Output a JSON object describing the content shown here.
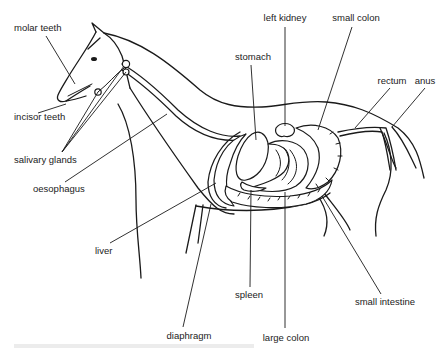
{
  "diagram": {
    "stroke_color": "#1a1a1a",
    "label_color": "#222222",
    "background": "#ffffff",
    "labels": [
      {
        "id": "molar-teeth",
        "text": "molar teeth",
        "x": 14,
        "y": 31,
        "anchor": "start",
        "leader": [
          [
            46,
            36
          ],
          [
            75,
            84
          ]
        ]
      },
      {
        "id": "incisor-teeth",
        "text": "incisor teeth",
        "x": 14,
        "y": 120,
        "anchor": "start",
        "leader": [
          [
            38,
            113
          ],
          [
            66,
            104
          ]
        ]
      },
      {
        "id": "salivary-glands",
        "text": "salivary glands",
        "x": 14,
        "y": 163,
        "anchor": "start",
        "leader": [
          [
            62,
            152
          ],
          [
            98,
            92
          ],
          [
            62,
            152
          ],
          [
            97,
            103
          ],
          [
            62,
            152
          ],
          [
            66,
            100
          ]
        ]
      },
      {
        "id": "oesophagus",
        "text": "oesophagus",
        "x": 33,
        "y": 192,
        "anchor": "start",
        "leader": [
          [
            65,
            182
          ],
          [
            167,
            114
          ]
        ]
      },
      {
        "id": "liver",
        "text": "liver",
        "x": 95,
        "y": 254,
        "anchor": "start",
        "leader": [
          [
            110,
            243
          ],
          [
            216,
            183
          ]
        ]
      },
      {
        "id": "stomach",
        "text": "stomach",
        "x": 253,
        "y": 60,
        "anchor": "middle",
        "leader": [
          [
            251,
            65
          ],
          [
            256,
            132
          ]
        ]
      },
      {
        "id": "left-kidney",
        "text": "left kidney",
        "x": 285,
        "y": 21,
        "anchor": "middle",
        "leader": [
          [
            285,
            27
          ],
          [
            285,
            125
          ]
        ]
      },
      {
        "id": "small-colon",
        "text": "small colon",
        "x": 356,
        "y": 21,
        "anchor": "middle",
        "leader": [
          [
            352,
            27
          ],
          [
            318,
            127
          ]
        ]
      },
      {
        "id": "rectum",
        "text": "rectum",
        "x": 392,
        "y": 84,
        "anchor": "middle",
        "leader": [
          [
            390,
            88
          ],
          [
            355,
            125
          ]
        ]
      },
      {
        "id": "anus",
        "text": "anus",
        "x": 425,
        "y": 84,
        "anchor": "middle",
        "leader": [
          [
            425,
            88
          ],
          [
            392,
            127
          ]
        ]
      },
      {
        "id": "spleen",
        "text": "spleen",
        "x": 249,
        "y": 298,
        "anchor": "middle",
        "leader": [
          [
            250,
            287
          ],
          [
            251,
            194
          ]
        ]
      },
      {
        "id": "small-intestine",
        "text": "small intestine",
        "x": 385,
        "y": 305,
        "anchor": "middle",
        "leader": [
          [
            381,
            294
          ],
          [
            325,
            205
          ]
        ]
      },
      {
        "id": "diaphragm",
        "text": "diaphragm",
        "x": 189,
        "y": 339,
        "anchor": "middle",
        "leader": [
          [
            183,
            327
          ],
          [
            213,
            204
          ]
        ]
      },
      {
        "id": "large-colon",
        "text": "large colon",
        "x": 286,
        "y": 341,
        "anchor": "middle",
        "leader": [
          [
            285,
            328
          ],
          [
            285,
            198
          ]
        ]
      }
    ]
  }
}
